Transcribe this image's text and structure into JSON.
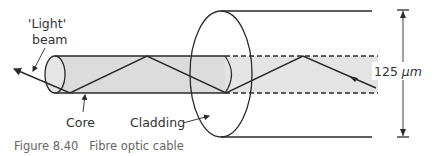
{
  "diagram": {
    "labels": {
      "light_beam_line1": "'Light'",
      "light_beam_line2": "beam",
      "core": "Core",
      "cladding": "Cladding",
      "diameter_value": "125 ",
      "diameter_unit": "μm"
    },
    "caption": "Figure 8.40   Fibre optic cable",
    "colors": {
      "core_fill": "#dcdcdc",
      "line": "#2a2a2a",
      "text": "#333333",
      "caption": "#666666"
    }
  }
}
